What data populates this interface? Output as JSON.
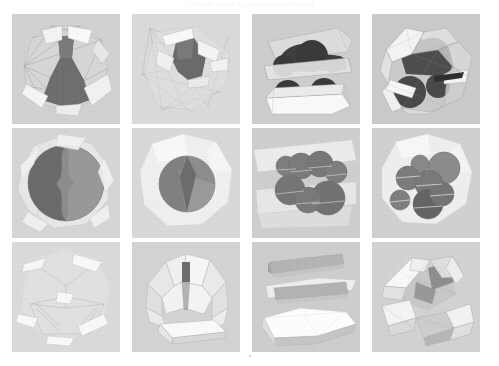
{
  "page": {
    "header_caption": "Collision Mesh Approximation Results",
    "footer_caption": "",
    "background_color": "#ffffff",
    "panel_background_color": "#d6d6d6"
  },
  "figure": {
    "type": "image-grid",
    "rows": 3,
    "columns": 4,
    "cell_count": 12,
    "row_labels": [
      "row-1-convex-hull-decomposition",
      "row-2-sphere-primitive-fit",
      "row-3-planar-slab-fit"
    ],
    "panels": [
      {
        "index": 1,
        "row": 1,
        "column": 1,
        "name": "triangulated-anvil-mesh",
        "description": "Dark triangulated anvil-like solid inside a pale polygonal wireframe shell",
        "fill_color": "#6e6e6e",
        "shell_color": "#f2f2f2",
        "background_color": "#d3d3d3"
      },
      {
        "index": 2,
        "row": 1,
        "column": 2,
        "name": "sparse-wireframe-blob",
        "description": "Dark rounded triangular blob with sparse long wireframe edges radiating outward",
        "fill_color": "#6b6b6b",
        "shell_color": "#ededed",
        "background_color": "#dcdcdc"
      },
      {
        "index": 3,
        "row": 1,
        "column": 3,
        "name": "car-silhouette-slabs",
        "description": "Car-like dark body with four dark wheel blobs between pale flat slabs",
        "fill_color": "#4a4a4a",
        "shell_color": "#f4f4f4",
        "background_color": "#cfcfcf"
      },
      {
        "index": 4,
        "row": 1,
        "column": 4,
        "name": "faceted-hull-dark-core",
        "description": "Dark rounded core enclosed in a faceted light polyhedral hull",
        "fill_color": "#545454",
        "shell_color": "#f0f0f0",
        "background_color": "#cccccc"
      },
      {
        "index": 5,
        "row": 2,
        "column": 1,
        "name": "triangulated-sphere-split",
        "description": "Large sphere split into a dense triangulated dark hemisphere and a smooth light region",
        "fill_color": "#6a6a6a",
        "shell_color": "#eaeaea",
        "background_color": "#d7d7d7"
      },
      {
        "index": 6,
        "row": 2,
        "column": 2,
        "name": "single-sphere-primitive",
        "description": "Single medium gray sphere with a darker wedge, inside a pale rounded hull",
        "fill_color": "#8a8a8a",
        "shell_color": "#f3f3f3",
        "background_color": "#dadada"
      },
      {
        "index": 7,
        "row": 2,
        "column": 3,
        "name": "six-sphere-cluster",
        "description": "Cluster of six overlapping gray spheres arranged over a pale slab",
        "fill_color": "#7d7d7d",
        "shell_color": "#eeeeee",
        "background_color": "#d0d0d0"
      },
      {
        "index": 8,
        "row": 2,
        "column": 4,
        "name": "mixed-sphere-cluster",
        "description": "Five spheres of varying radii inside a pale polygonal boundary",
        "fill_color": "#828282",
        "shell_color": "#f1f1f1",
        "background_color": "#d2d2d2"
      },
      {
        "index": 9,
        "row": 3,
        "column": 1,
        "name": "thin-sliver-wireframe",
        "description": "Very pale thin sliver polygons with faint wireframe edges, nearly washed out",
        "fill_color": "#e3e3e3",
        "shell_color": "#fafafa",
        "background_color": "#dcdcdc"
      },
      {
        "index": 10,
        "row": 3,
        "column": 2,
        "name": "pale-dome-hull",
        "description": "Pale faceted dome shell over a flat base plate, dark narrow opening at the apex",
        "fill_color": "#dcdcdc",
        "shell_color": "#f8f8f8",
        "background_color": "#d5d5d5"
      },
      {
        "index": 11,
        "row": 3,
        "column": 3,
        "name": "stacked-flat-slabs",
        "description": "Three stacked flat elongated slabs, lowest one bright white",
        "fill_color": "#b9b9b9",
        "shell_color": "#ffffff",
        "background_color": "#cfcfcf"
      },
      {
        "index": 12,
        "row": 3,
        "column": 4,
        "name": "wedge-pair-hull",
        "description": "Two large faceted wedge blocks meeting at a shaded central notch",
        "fill_color": "#c4c4c4",
        "shell_color": "#fdfdfd",
        "background_color": "#d4d4d4"
      }
    ]
  }
}
